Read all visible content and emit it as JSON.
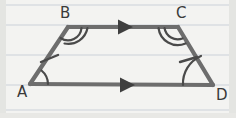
{
  "figure": {
    "background_color": "#f3f3f1",
    "paper": {
      "type": "ruled-notebook-paper",
      "line_color": "#d8dde0",
      "rule_positions_y": [
        5,
        25,
        55,
        85,
        110
      ],
      "edge_shadow_color": "#c9cbc8"
    },
    "stroke": {
      "color": "#6d6d6d",
      "dark_color": "#4a4a4a",
      "width": 4.2,
      "mark_width": 2.4
    },
    "vertices": [
      {
        "name": "A",
        "label": "A",
        "x": 30,
        "y": 84,
        "label_x": 17,
        "label_y": 97
      },
      {
        "name": "B",
        "label": "B",
        "x": 68,
        "y": 27,
        "label_x": 60,
        "label_y": 18
      },
      {
        "name": "C",
        "label": "C",
        "x": 178,
        "y": 27,
        "label_x": 176,
        "label_y": 18
      },
      {
        "name": "D",
        "label": "D",
        "x": 213,
        "y": 85,
        "label_x": 216,
        "label_y": 100
      }
    ],
    "sides": [
      {
        "name": "side-AB",
        "from": "A",
        "to": "B",
        "tick_marks": 1,
        "parallel_arrows": 0
      },
      {
        "name": "side-BC",
        "from": "B",
        "to": "C",
        "tick_marks": 0,
        "parallel_arrows": 1
      },
      {
        "name": "side-CD",
        "from": "C",
        "to": "D",
        "tick_marks": 1,
        "parallel_arrows": 0
      },
      {
        "name": "side-AD",
        "from": "A",
        "to": "D",
        "tick_marks": 0,
        "parallel_arrows": 1
      }
    ],
    "angle_marks": [
      {
        "name": "angle-A",
        "vertex": "A",
        "arcs": 1
      },
      {
        "name": "angle-B",
        "vertex": "B",
        "arcs": 2
      },
      {
        "name": "angle-C",
        "vertex": "C",
        "arcs": 2
      },
      {
        "name": "angle-D",
        "vertex": "D",
        "arcs": 1
      }
    ],
    "annotations": {
      "congruent_legs": "AB = CD (single tick marks)",
      "parallel_sides": "BC ∥ AD (single arrowheads)",
      "equal_base_angles": "∠A = ∠D (single arc), ∠B = ∠C (double arc)"
    }
  }
}
